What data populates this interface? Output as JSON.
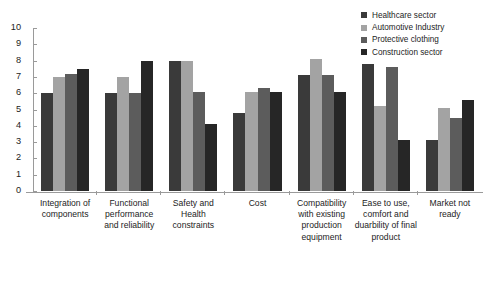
{
  "chart_data": {
    "type": "bar",
    "title": "",
    "xlabel": "",
    "ylabel": "",
    "ylim": [
      0,
      10
    ],
    "ytick_step": 1,
    "grid": false,
    "legend_position": "top-right",
    "categories": [
      "Integration of components",
      "Functional performance and reliability",
      "Safety and Health constraints",
      "Cost",
      "Compatibility with existing production equipment",
      "Ease to use, comfort and duarbility of final product",
      "Market not ready"
    ],
    "ytick_labels": [
      "10",
      "9",
      "8",
      "7",
      "6",
      "5",
      "4",
      "3",
      "2",
      "1",
      "0"
    ],
    "series": [
      {
        "name": "Healthcare sector",
        "color": "#3a3a3a",
        "values": [
          6.0,
          6.0,
          8.0,
          4.8,
          7.1,
          7.8,
          3.1
        ]
      },
      {
        "name": "Automotive Industry",
        "color": "#a3a3a3",
        "values": [
          7.0,
          7.0,
          8.0,
          6.1,
          8.1,
          5.2,
          5.1
        ]
      },
      {
        "name": "Protective clothing",
        "color": "#5c5c5c",
        "values": [
          7.2,
          6.0,
          6.1,
          6.3,
          7.1,
          7.6,
          4.5
        ]
      },
      {
        "name": "Construction sector",
        "color": "#262626",
        "values": [
          7.5,
          8.0,
          4.1,
          6.1,
          6.1,
          3.1,
          5.6
        ]
      }
    ]
  },
  "axis": {
    "line_color": "#9a9a9a"
  }
}
